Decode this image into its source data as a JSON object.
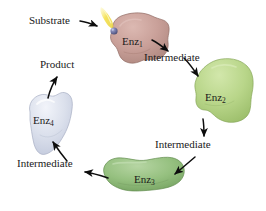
{
  "figure": {
    "type": "cyclic-enzyme-pathway-diagram",
    "background_color": "#ffffff",
    "text_color": "#1a1a1a"
  },
  "labels": {
    "substrate": "Substrate",
    "product": "Product",
    "intermediate_1": "Intermediate",
    "intermediate_2": "Intermediate",
    "intermediate_3": "Intermediate"
  },
  "enzymes": [
    {
      "id": "enz1",
      "name": "Enz",
      "subscript": "1",
      "fill": "#c9a099",
      "stroke": "#8f6a63",
      "highlight": "#dcb9b2"
    },
    {
      "id": "enz2",
      "name": "Enz",
      "subscript": "2",
      "fill": "#b9d68a",
      "stroke": "#83a455",
      "highlight": "#d2e7ab"
    },
    {
      "id": "enz3",
      "name": "Enz",
      "subscript": "3",
      "fill": "#95c07f",
      "stroke": "#5f8a4c",
      "highlight": "#b6d5a3"
    },
    {
      "id": "enz4",
      "name": "Enz",
      "subscript": "4",
      "fill": "#dbe0ec",
      "stroke": "#a9b0c4",
      "highlight": "#eef1f7"
    }
  ],
  "substrate_marker": {
    "name": "substrate-molecule",
    "sphere_color": "#6b6f9e",
    "sphere_highlight": "#a7abd0",
    "beam_color": "#f5e35c",
    "beam_glow": "#fbf4ad"
  },
  "arrows": {
    "color": "#0d0d0d",
    "items": [
      {
        "name": "substrate-pointer",
        "from": "Substrate label",
        "to": "substrate molecule"
      },
      {
        "name": "enz1-to-intermediate1",
        "from": "Enz1",
        "to": "Intermediate"
      },
      {
        "name": "intermediate1-to-enz2",
        "from": "Intermediate",
        "to": "Enz2"
      },
      {
        "name": "enz2-to-intermediate2",
        "from": "Enz2",
        "to": "Intermediate"
      },
      {
        "name": "intermediate2-to-enz3",
        "from": "Intermediate",
        "to": "Enz3"
      },
      {
        "name": "enz3-to-intermediate3",
        "from": "Enz3",
        "to": "Intermediate"
      },
      {
        "name": "intermediate3-to-enz4",
        "from": "Intermediate",
        "to": "Enz4"
      },
      {
        "name": "enz4-to-product",
        "from": "Enz4",
        "to": "Product"
      }
    ]
  }
}
